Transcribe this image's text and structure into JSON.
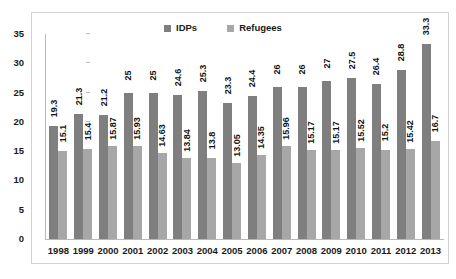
{
  "chart_data": {
    "type": "bar",
    "title": "",
    "subtitle": "",
    "xlabel": "",
    "ylabel": "",
    "ylim": [
      0,
      35
    ],
    "yticks": [
      0,
      5,
      10,
      15,
      20,
      25,
      30,
      35
    ],
    "grid": false,
    "legend_position": "top-center",
    "categories": [
      "1998",
      "1999",
      "2000",
      "2001",
      "2002",
      "2003",
      "2004",
      "2005",
      "2006",
      "2007",
      "2008",
      "2009",
      "2010",
      "2011",
      "2012",
      "2013"
    ],
    "series": [
      {
        "name": "IDPs",
        "color": "#7f7f7f",
        "values": [
          19.3,
          21.3,
          21.2,
          25,
          25,
          24.6,
          25.3,
          23.3,
          24.4,
          26,
          26,
          27,
          27.5,
          26.4,
          28.8,
          33.3
        ],
        "labels": [
          "19.3",
          "21.3",
          "21.2",
          "25",
          "25",
          "24.6",
          "25.3",
          "23.3",
          "24.4",
          "26",
          "26",
          "27",
          "27.5",
          "26.4",
          "28.8",
          "33.3"
        ]
      },
      {
        "name": "Refugees",
        "color": "#a7a7a7",
        "values": [
          15.1,
          15.4,
          15.87,
          15.93,
          14.63,
          13.84,
          13.8,
          13.05,
          14.35,
          15.96,
          15.17,
          15.17,
          15.52,
          15.2,
          15.42,
          16.7
        ],
        "labels": [
          "15.1",
          "15.4",
          "15.87",
          "15.93",
          "14.63",
          "13.84",
          "13.8",
          "13.05",
          "14.35",
          "15.96",
          "15.17",
          "15.17",
          "15.52",
          "15.2",
          "15.42",
          "16.7"
        ]
      }
    ]
  }
}
